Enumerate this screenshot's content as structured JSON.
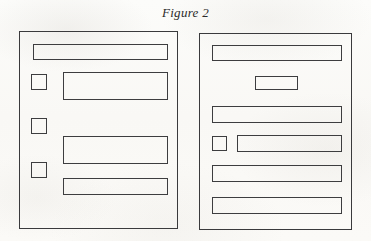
{
  "figure": {
    "caption": "Figure 2",
    "background_color": "#fbfbf9",
    "stroke_color": "#3d3d3f"
  },
  "panels": [
    {
      "id": "left-panel",
      "name": "left-document-page",
      "x": 19,
      "y": 31,
      "width": 159,
      "height": 198,
      "elements": [
        {
          "name": "header-bar",
          "type": "bar",
          "x": 33,
          "y": 44,
          "width": 135,
          "height": 16
        },
        {
          "name": "bullet-marker-1",
          "type": "square",
          "x": 31,
          "y": 74,
          "width": 16,
          "height": 16
        },
        {
          "name": "text-block-1",
          "type": "bar",
          "x": 63,
          "y": 72,
          "width": 105,
          "height": 28
        },
        {
          "name": "bullet-marker-2",
          "type": "square",
          "x": 31,
          "y": 118,
          "width": 16,
          "height": 16
        },
        {
          "name": "text-block-2",
          "type": "bar",
          "x": 63,
          "y": 136,
          "width": 105,
          "height": 28
        },
        {
          "name": "bullet-marker-3",
          "type": "square",
          "x": 31,
          "y": 162,
          "width": 16,
          "height": 16
        },
        {
          "name": "text-block-3",
          "type": "bar",
          "x": 63,
          "y": 178,
          "width": 105,
          "height": 17
        }
      ]
    },
    {
      "id": "right-panel",
      "name": "right-document-page",
      "x": 199,
      "y": 33,
      "width": 153,
      "height": 197,
      "elements": [
        {
          "name": "header-bar",
          "type": "bar",
          "x": 212,
          "y": 45,
          "width": 130,
          "height": 16
        },
        {
          "name": "centered-label-box",
          "type": "bar",
          "x": 255,
          "y": 76,
          "width": 43,
          "height": 14
        },
        {
          "name": "text-block-1",
          "type": "bar",
          "x": 212,
          "y": 106,
          "width": 130,
          "height": 17
        },
        {
          "name": "bullet-marker-1",
          "type": "square",
          "x": 212,
          "y": 136,
          "width": 15,
          "height": 15
        },
        {
          "name": "text-block-2",
          "type": "bar",
          "x": 237,
          "y": 135,
          "width": 105,
          "height": 17
        },
        {
          "name": "text-block-3",
          "type": "bar",
          "x": 212,
          "y": 165,
          "width": 130,
          "height": 17
        },
        {
          "name": "text-block-4",
          "type": "bar",
          "x": 212,
          "y": 197,
          "width": 130,
          "height": 17
        }
      ]
    }
  ]
}
